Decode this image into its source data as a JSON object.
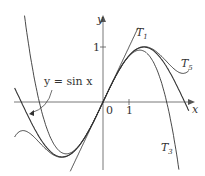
{
  "chart_data": {
    "type": "line",
    "title": "",
    "xlabel": "x",
    "ylabel": "y",
    "xlim": [
      -3.4,
      3.4
    ],
    "ylim": [
      -1.3,
      1.6
    ],
    "x_ticks": [
      {
        "value": 0,
        "label": "0"
      },
      {
        "value": 1,
        "label": "1"
      }
    ],
    "y_ticks": [
      {
        "value": 1,
        "label": "1"
      }
    ],
    "grid": false,
    "series": [
      {
        "name": "y = sin x",
        "formula": "sin(x)"
      },
      {
        "name": "T1",
        "formula": "x"
      },
      {
        "name": "T3",
        "formula": "x - x^3/6"
      },
      {
        "name": "T5",
        "formula": "x - x^3/6 + x^5/120"
      }
    ],
    "annotations": [
      "y = sin x",
      "T1",
      "T3",
      "T5"
    ]
  },
  "labels": {
    "y_axis": "y",
    "x_axis": "x",
    "origin": "0",
    "x_tick_1": "1",
    "y_tick_1": "1",
    "sin_label": "y = sin x",
    "T1": "T",
    "T1_sub": "1",
    "T3": "T",
    "T3_sub": "3",
    "T5": "T",
    "T5_sub": "5"
  },
  "colors": {
    "curve": "#333333",
    "axis": "#555555"
  }
}
